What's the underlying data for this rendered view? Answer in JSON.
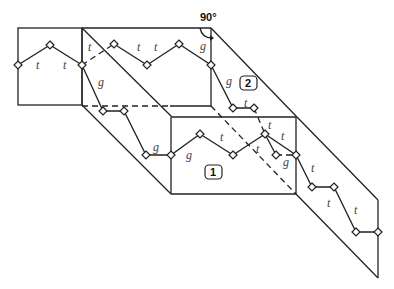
{
  "diagram": {
    "angle_label": "90°",
    "planes": [
      {
        "id": "1",
        "label": "1"
      },
      {
        "id": "2",
        "label": "2"
      }
    ],
    "bond_labels": {
      "left_panel": [
        "t",
        "t"
      ],
      "back_panel": [
        "t",
        "t",
        "t",
        "g"
      ],
      "connector": [
        "g",
        "g"
      ],
      "inner_chain": [
        "g",
        "t"
      ],
      "front_panel": [
        "g",
        "t",
        "t",
        "t",
        "t",
        "g"
      ],
      "right_panel": [
        "t",
        "t",
        "t"
      ]
    },
    "labels": [
      {
        "text": "t",
        "x": 36,
        "y": 69
      },
      {
        "text": "t",
        "x": 63,
        "y": 69
      },
      {
        "text": "t",
        "x": 88,
        "y": 51
      },
      {
        "text": "t",
        "x": 137,
        "y": 51
      },
      {
        "text": "t",
        "x": 154,
        "y": 51
      },
      {
        "text": "g",
        "x": 200,
        "y": 50
      },
      {
        "text": "g",
        "x": 98,
        "y": 86
      },
      {
        "text": "g",
        "x": 226,
        "y": 85
      },
      {
        "text": "t",
        "x": 244,
        "y": 107
      },
      {
        "text": "g",
        "x": 153,
        "y": 151
      },
      {
        "text": "g",
        "x": 186,
        "y": 159
      },
      {
        "text": "t",
        "x": 220,
        "y": 141
      },
      {
        "text": "t",
        "x": 256,
        "y": 153
      },
      {
        "text": "t",
        "x": 268,
        "y": 129
      },
      {
        "text": "t",
        "x": 281,
        "y": 140
      },
      {
        "text": "g",
        "x": 283,
        "y": 166
      },
      {
        "text": "t",
        "x": 311,
        "y": 172
      },
      {
        "text": "t",
        "x": 327,
        "y": 207
      },
      {
        "text": "t",
        "x": 354,
        "y": 214
      }
    ]
  }
}
